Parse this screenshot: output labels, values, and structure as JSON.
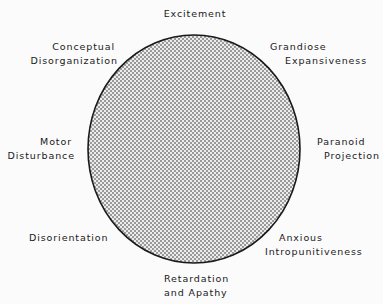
{
  "diagram": {
    "shape": "circle",
    "fill_pattern": "crosshatch",
    "colors": {
      "background": "#fbfbfb",
      "outline": "#1a1a1a",
      "hatch": "#8a8a8a",
      "text": "#1a1a1a"
    },
    "labels": {
      "top": [
        "Excitement"
      ],
      "top_right": [
        "Grandiose",
        "Expansiveness"
      ],
      "right": [
        "Paranoid",
        "Projection"
      ],
      "bottom_right": [
        "Anxious",
        "Intropunitiveness"
      ],
      "bottom": [
        "Retardation",
        "and Apathy"
      ],
      "bottom_left": [
        "Disorientation"
      ],
      "left": [
        "Motor",
        "Disturbance"
      ],
      "top_left": [
        "Conceptual",
        "Disorganization"
      ]
    }
  }
}
